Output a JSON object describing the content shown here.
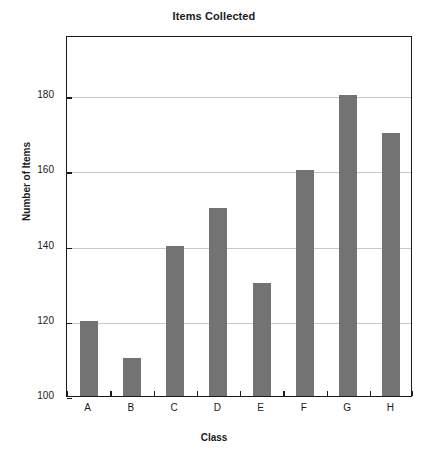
{
  "chart_data": {
    "type": "bar",
    "title": "Items Collected",
    "xlabel": "Class",
    "ylabel": "Number of Items",
    "categories": [
      "A",
      "B",
      "C",
      "D",
      "E",
      "F",
      "G",
      "H"
    ],
    "values": [
      120,
      110,
      140,
      150,
      130,
      160,
      180,
      170
    ],
    "ylim": [
      100,
      196
    ],
    "yticks": [
      100,
      120,
      140,
      160,
      180
    ],
    "ytick_labels": [
      "100",
      "120",
      "140",
      "160",
      "180"
    ],
    "grid": true,
    "gridlines_at": [
      120,
      140,
      160,
      180
    ],
    "legend": null,
    "legend_position": "none",
    "series": [
      {
        "name": "Items Collected",
        "values": [
          120,
          110,
          140,
          150,
          130,
          160,
          180,
          170
        ]
      }
    ],
    "colors": {
      "bar": "#737373",
      "axis": "#1a1a1a",
      "grid": "#c8c8c8",
      "background": "#ffffff"
    }
  }
}
